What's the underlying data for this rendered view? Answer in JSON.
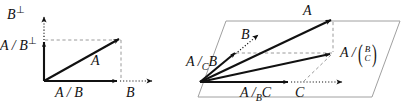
{
  "figure": {
    "panels": [
      {
        "id": "left-panel",
        "name": "orthogonal-decomposition-2d",
        "labels": {
          "vertical_axis": "B",
          "vertical_axis_sup": "⊥",
          "vertical_component": "A / B",
          "vertical_component_sup": "⊥",
          "resultant": "A",
          "horizontal_component": "A / B",
          "horizontal_axis": "B"
        }
      },
      {
        "id": "right-panel",
        "name": "plane-decomposition-3d",
        "labels": {
          "resultant": "A",
          "b_direction": "B",
          "a_over_c_b": "A /",
          "a_over_c_b_sub": "C",
          "a_over_c_b_tail": "B",
          "a_over_bc_head": "A /",
          "a_over_bc_num": "B",
          "a_over_bc_den": "C",
          "a_over_b_c": "A /",
          "a_over_b_c_sub": "B",
          "a_over_b_c_tail": "C",
          "c_direction": "C"
        }
      }
    ],
    "colors": {
      "ink": "#111111",
      "dashed_gray": "#8c8c8c",
      "plane_outline": "#9a9a9a",
      "background": "#ffffff"
    }
  }
}
